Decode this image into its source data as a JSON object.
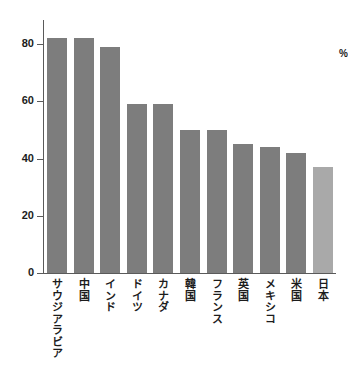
{
  "chart_data": {
    "type": "bar",
    "title": "",
    "subtitle": "",
    "xlabel": "",
    "ylabel": "%",
    "ylim": [
      0,
      88
    ],
    "yticks": [
      0,
      20,
      40,
      60,
      80
    ],
    "ytick_labels": [
      "0",
      "20",
      "40",
      "60",
      "80"
    ],
    "grid": false,
    "legend": "none",
    "orientation": "vertical",
    "categories": [
      "サウジアラビア",
      "中国",
      "インド",
      "ドイツ",
      "カナダ",
      "韓国",
      "フランス",
      "英国",
      "メキシコ",
      "米国",
      "日本"
    ],
    "values": [
      82,
      82,
      79,
      59,
      59,
      50,
      50,
      45,
      44,
      42,
      37
    ],
    "bar_colors": [
      "#7d7d7d",
      "#7d7d7d",
      "#7d7d7d",
      "#7d7d7d",
      "#7d7d7d",
      "#7d7d7d",
      "#7d7d7d",
      "#7d7d7d",
      "#7d7d7d",
      "#7d7d7d",
      "#a9a9a9"
    ],
    "highlight_index": 10,
    "axis_color": "#5a5a5a",
    "background": "#ffffff",
    "text_color": "#1c1c1c"
  },
  "axis": {
    "unit_label": "%"
  }
}
